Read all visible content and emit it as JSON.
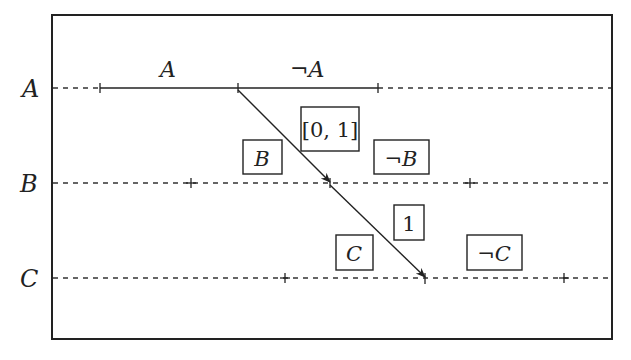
{
  "diagram": {
    "type": "probability-tree-timeline",
    "rows": [
      {
        "id": "A",
        "label": "A",
        "y": 88,
        "ticks": [
          100,
          238,
          378
        ]
      },
      {
        "id": "B",
        "label": "B",
        "y": 183,
        "ticks": [
          191,
          330,
          470
        ]
      },
      {
        "id": "C",
        "label": "C",
        "y": 278,
        "ticks": [
          285,
          425,
          564
        ]
      }
    ],
    "segment_labels": {
      "a_true": "A",
      "a_false": "¬A"
    },
    "boxes": {
      "interval": "[0, 1]",
      "b_true": "B",
      "b_false": "¬B",
      "one": "1",
      "c_true": "C",
      "c_false": "¬C"
    },
    "arrows": [
      {
        "from": "A",
        "to": "B",
        "label": "[0, 1]"
      },
      {
        "from": "B",
        "to": "C",
        "label": "1"
      }
    ],
    "colors": {
      "stroke": "#222222",
      "background": "#ffffff"
    }
  }
}
